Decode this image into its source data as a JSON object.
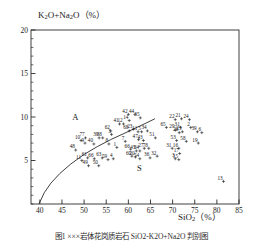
{
  "figure": {
    "caption": "图1  ×××岩体花岗质岩石 SiO2-K2O+Na2O 判别图",
    "y_axis_label_main": "K",
    "y_axis_label": "K2O+Na2O（%）",
    "x_axis_label": "SiO2（%）"
  },
  "chart_data": {
    "type": "scatter",
    "title": "",
    "xlabel": "SiO2 (%)",
    "ylabel": "K2O+Na2O (%)",
    "xlim": [
      38,
      85
    ],
    "ylim": [
      0,
      20
    ],
    "xticks": [
      40,
      45,
      50,
      55,
      60,
      65,
      70,
      75,
      80,
      85
    ],
    "yticks": [
      5,
      10,
      15,
      20
    ],
    "minor_tick_step": 1,
    "grid": false,
    "legend": "none",
    "annotations": [
      {
        "text": "A",
        "x": 48.0,
        "y": 9.6,
        "meaning": "alkaline-field"
      },
      {
        "text": "S",
        "x": 62.5,
        "y": 3.8,
        "meaning": "subalkaline-field"
      }
    ],
    "divider_curve": {
      "name": "alkaline-subalkaline-boundary",
      "points": [
        [
          39.8,
          0.0
        ],
        [
          41.0,
          1.3
        ],
        [
          42.5,
          2.4
        ],
        [
          44.5,
          3.5
        ],
        [
          47.0,
          4.6
        ],
        [
          50.0,
          5.7
        ],
        [
          53.0,
          6.6
        ],
        [
          56.0,
          7.4
        ],
        [
          59.0,
          8.1
        ],
        [
          61.5,
          8.7
        ],
        [
          64.0,
          9.3
        ],
        [
          66.0,
          9.8
        ]
      ]
    },
    "points": [
      {
        "label": "48",
        "x": 48.1,
        "y": 6.2
      },
      {
        "label": "10",
        "x": 49.3,
        "y": 7.3
      },
      {
        "label": "77",
        "x": 50.3,
        "y": 7.6
      },
      {
        "label": "9",
        "x": 50.2,
        "y": 7.0
      },
      {
        "label": "11",
        "x": 49.5,
        "y": 5.0
      },
      {
        "label": "61",
        "x": 50.8,
        "y": 5.3
      },
      {
        "label": "49",
        "x": 51.0,
        "y": 4.4
      },
      {
        "label": "40",
        "x": 52.2,
        "y": 6.9
      },
      {
        "label": "66",
        "x": 52.3,
        "y": 5.2
      },
      {
        "label": "50",
        "x": 53.3,
        "y": 4.4
      },
      {
        "label": "39",
        "x": 53.4,
        "y": 7.6
      },
      {
        "label": "38",
        "x": 54.2,
        "y": 7.6
      },
      {
        "label": "63",
        "x": 54.1,
        "y": 5.3
      },
      {
        "label": "62",
        "x": 56.0,
        "y": 8.4
      },
      {
        "label": "59",
        "x": 55.4,
        "y": 5.1
      },
      {
        "label": "8",
        "x": 55.6,
        "y": 6.9
      },
      {
        "label": "3",
        "x": 56.2,
        "y": 8.0
      },
      {
        "label": "4",
        "x": 56.6,
        "y": 5.2
      },
      {
        "label": "1",
        "x": 57.4,
        "y": 6.5
      },
      {
        "label": "41",
        "x": 58.0,
        "y": 9.2
      },
      {
        "label": "12",
        "x": 58.9,
        "y": 9.2
      },
      {
        "label": "42",
        "x": 60.0,
        "y": 10.3
      },
      {
        "label": "14",
        "x": 60.2,
        "y": 9.6
      },
      {
        "label": "44",
        "x": 61.5,
        "y": 10.3
      },
      {
        "label": "35",
        "x": 62.7,
        "y": 9.9
      },
      {
        "label": "68",
        "x": 60.2,
        "y": 8.4
      },
      {
        "label": "23",
        "x": 61.1,
        "y": 8.6
      },
      {
        "label": "7",
        "x": 59.3,
        "y": 7.2
      },
      {
        "label": "11",
        "x": 62.2,
        "y": 8.3
      },
      {
        "label": "5",
        "x": 63.0,
        "y": 8.3
      },
      {
        "label": "34",
        "x": 64.3,
        "y": 8.4
      },
      {
        "label": "47",
        "x": 62.3,
        "y": 7.4
      },
      {
        "label": "66",
        "x": 60.5,
        "y": 6.3
      },
      {
        "label": "45",
        "x": 61.8,
        "y": 6.1
      },
      {
        "label": "64",
        "x": 62.6,
        "y": 6.1
      },
      {
        "label": "60",
        "x": 60.8,
        "y": 5.5
      },
      {
        "label": "20",
        "x": 61.6,
        "y": 5.4
      },
      {
        "label": "54",
        "x": 62.6,
        "y": 5.2
      },
      {
        "label": "43",
        "x": 63.4,
        "y": 7.3
      },
      {
        "label": "27",
        "x": 63.6,
        "y": 6.4
      },
      {
        "label": "78",
        "x": 64.6,
        "y": 6.4
      },
      {
        "label": "36",
        "x": 64.9,
        "y": 5.3
      },
      {
        "label": "51",
        "x": 66.1,
        "y": 7.6
      },
      {
        "label": "32",
        "x": 66.5,
        "y": 5.5
      },
      {
        "label": "65",
        "x": 68.6,
        "y": 8.8
      },
      {
        "label": "22",
        "x": 70.6,
        "y": 9.7
      },
      {
        "label": "21",
        "x": 72.0,
        "y": 9.8
      },
      {
        "label": "24",
        "x": 73.8,
        "y": 9.7
      },
      {
        "label": "29",
        "x": 70.6,
        "y": 8.5
      },
      {
        "label": "31",
        "x": 71.8,
        "y": 8.8
      },
      {
        "label": "28",
        "x": 71.5,
        "y": 8.2
      },
      {
        "label": "25",
        "x": 72.2,
        "y": 8.3
      },
      {
        "label": "2",
        "x": 74.1,
        "y": 8.8
      },
      {
        "label": "39",
        "x": 75.6,
        "y": 8.3
      },
      {
        "label": "6",
        "x": 76.6,
        "y": 8.2
      },
      {
        "label": "53",
        "x": 70.9,
        "y": 7.3
      },
      {
        "label": "58",
        "x": 73.1,
        "y": 7.2
      },
      {
        "label": "19",
        "x": 75.8,
        "y": 7.0
      },
      {
        "label": "31",
        "x": 69.9,
        "y": 6.4
      },
      {
        "label": "16",
        "x": 71.4,
        "y": 6.4
      },
      {
        "label": "17",
        "x": 71.6,
        "y": 5.8
      },
      {
        "label": "3",
        "x": 70.6,
        "y": 5.2
      },
      {
        "label": "15",
        "x": 71.4,
        "y": 5.1
      },
      {
        "label": "13",
        "x": 81.5,
        "y": 2.6
      }
    ]
  },
  "axis_ticks": {
    "y": [
      "20",
      "15",
      "10",
      "5"
    ],
    "x": [
      "40",
      "45",
      "50",
      "55",
      "60",
      "65",
      "70",
      "75",
      "80",
      "85"
    ]
  }
}
